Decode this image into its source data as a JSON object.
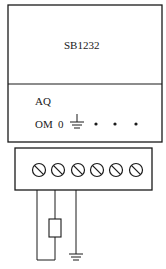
{
  "module": {
    "name": "SB1232",
    "section_label": "AQ",
    "terminal_labels": [
      "OM",
      "0"
    ],
    "ground_symbol": "ground-icon",
    "dots_count": 3
  },
  "terminal_block": {
    "screw_count": 6
  },
  "wiring": {
    "load": "resistor",
    "ground": "ground-icon"
  },
  "colors": {
    "line": "#1a1a1a",
    "background": "#ffffff"
  }
}
